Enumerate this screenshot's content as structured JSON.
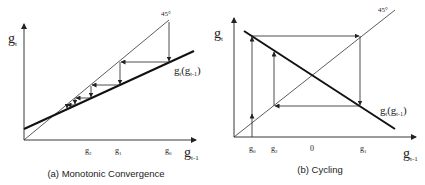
{
  "panels": [
    {
      "id": "a",
      "caption": "(a) Monotonic Convergence",
      "y_axis_label": "g",
      "y_axis_sub": "t",
      "x_axis_label": "g",
      "x_axis_sub": "t-1",
      "diagonal_label": "45°",
      "curve_label": "g",
      "curve_label_sub": "t",
      "curve_label_arg": "(g",
      "curve_label_arg_sub": "t-1",
      "curve_label_close": ")",
      "ticks": [
        {
          "label": "g",
          "sub": "2"
        },
        {
          "label": "g",
          "sub": "1"
        },
        {
          "label": "g",
          "sub": "0"
        }
      ]
    },
    {
      "id": "b",
      "caption": "(b) Cycling",
      "y_axis_label": "g",
      "y_axis_sub": "t",
      "x_axis_label": "g",
      "x_axis_sub": "t-1",
      "diagonal_label": "45°",
      "curve_label": "g",
      "curve_label_sub": "t",
      "curve_label_arg": "(g",
      "curve_label_arg_sub": "t-1",
      "curve_label_close": ")",
      "ticks": [
        {
          "label": "g",
          "sub": "0"
        },
        {
          "label": "g",
          "sub": "2"
        },
        {
          "label": "0",
          "sub": ""
        },
        {
          "label": "g",
          "sub": "1"
        }
      ]
    }
  ],
  "colors": {
    "line": "#222222",
    "background": "#ffffff"
  }
}
